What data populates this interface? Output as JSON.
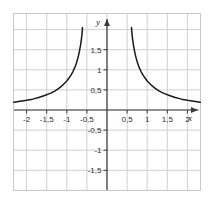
{
  "chart_data": {
    "type": "line",
    "title": "",
    "subtitle": "",
    "xlabel": "x",
    "ylabel": "y",
    "xlim": [
      -2.4,
      2.4
    ],
    "ylim": [
      -1.8,
      2.1
    ],
    "grid": true,
    "grid_step": 0.5,
    "legend": "none",
    "decimal_separator": ",",
    "x_ticks": [
      {
        "value": -2,
        "label": "-2"
      },
      {
        "value": -1.5,
        "label": "-1,5"
      },
      {
        "value": -1,
        "label": "-1"
      },
      {
        "value": -0.5,
        "label": "-0,5"
      },
      {
        "value": 0.5,
        "label": "0,5"
      },
      {
        "value": 1,
        "label": "1"
      },
      {
        "value": 1.5,
        "label": "1,5"
      },
      {
        "value": 2,
        "label": "2"
      }
    ],
    "y_ticks": [
      {
        "value": 1.5,
        "label": "1,5"
      },
      {
        "value": 1,
        "label": "1"
      },
      {
        "value": 0.5,
        "label": "0,5"
      },
      {
        "value": -0.5,
        "label": "-0,5"
      },
      {
        "value": -1,
        "label": "-1"
      },
      {
        "value": -1.5,
        "label": "-1,5"
      }
    ],
    "series": [
      {
        "name": "left-branch",
        "asymptote_x": -0.6,
        "points": [
          [
            -2.32,
            0.19
          ],
          [
            -2.2,
            0.21
          ],
          [
            -2.0,
            0.24
          ],
          [
            -1.85,
            0.27
          ],
          [
            -1.7,
            0.31
          ],
          [
            -1.55,
            0.36
          ],
          [
            -1.4,
            0.42
          ],
          [
            -1.3,
            0.47
          ],
          [
            -1.2,
            0.54
          ],
          [
            -1.1,
            0.62
          ],
          [
            -1.0,
            0.72
          ],
          [
            -0.95,
            0.79
          ],
          [
            -0.9,
            0.86
          ],
          [
            -0.85,
            0.95
          ],
          [
            -0.8,
            1.06
          ],
          [
            -0.76,
            1.17
          ],
          [
            -0.72,
            1.31
          ],
          [
            -0.69,
            1.44
          ],
          [
            -0.66,
            1.6
          ],
          [
            -0.64,
            1.74
          ],
          [
            -0.625,
            1.86
          ],
          [
            -0.615,
            1.97
          ],
          [
            -0.61,
            2.05
          ]
        ]
      },
      {
        "name": "right-branch",
        "asymptote_x": 0.6,
        "points": [
          [
            0.61,
            2.05
          ],
          [
            0.615,
            1.97
          ],
          [
            0.625,
            1.86
          ],
          [
            0.64,
            1.74
          ],
          [
            0.66,
            1.6
          ],
          [
            0.69,
            1.44
          ],
          [
            0.72,
            1.31
          ],
          [
            0.76,
            1.17
          ],
          [
            0.8,
            1.06
          ],
          [
            0.85,
            0.95
          ],
          [
            0.9,
            0.86
          ],
          [
            0.95,
            0.79
          ],
          [
            1.0,
            0.72
          ],
          [
            1.1,
            0.62
          ],
          [
            1.2,
            0.54
          ],
          [
            1.3,
            0.47
          ],
          [
            1.4,
            0.42
          ],
          [
            1.55,
            0.36
          ],
          [
            1.7,
            0.31
          ],
          [
            1.85,
            0.27
          ],
          [
            2.0,
            0.24
          ],
          [
            2.2,
            0.21
          ],
          [
            2.32,
            0.19
          ]
        ]
      }
    ],
    "colors": {
      "curve": "#1a1a1a",
      "axis": "#3a3a3a",
      "grid": "#cfcfd4",
      "frame": "#c8c8cc",
      "background": "#ffffff",
      "text": "#2b2b2b"
    }
  }
}
